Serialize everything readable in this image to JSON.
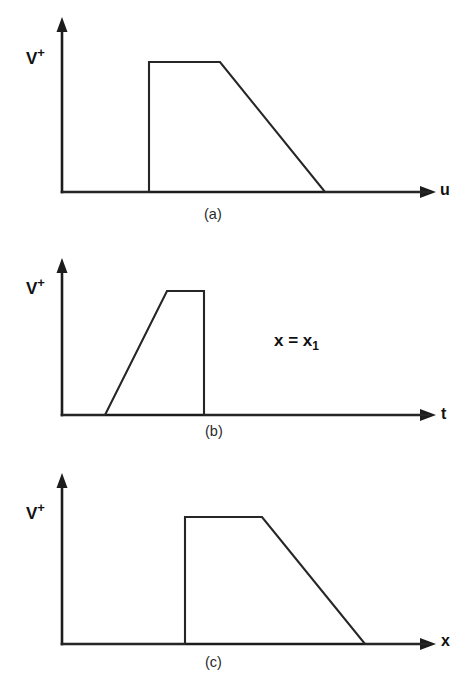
{
  "figure": {
    "background_color": "#ffffff",
    "line_color": "#262626",
    "panels": [
      {
        "id": "a",
        "caption": "(a)",
        "ylabel_base": "V",
        "ylabel_sup": "+",
        "xlabel": "u"
      },
      {
        "id": "b",
        "caption": "(b)",
        "ylabel_base": "V",
        "ylabel_sup": "+",
        "xlabel": "t",
        "annotation_base": "x = x",
        "annotation_sub": "1"
      },
      {
        "id": "c",
        "caption": "(c)",
        "ylabel_base": "V",
        "ylabel_sup": "+",
        "xlabel": "x"
      }
    ]
  },
  "chart_data": [
    {
      "type": "line",
      "title": "(a)",
      "xlabel": "u",
      "ylabel": "V+",
      "xlim": [
        0,
        400
      ],
      "ylim": [
        0,
        1.25
      ],
      "grid": false,
      "legend": "none",
      "axis_origin_px": [
        62,
        192
      ],
      "series": [
        {
          "name": "V+(u)",
          "comment": "trapezoidal pulse: instantaneous rise, flat top, linear decay to zero",
          "x": [
            62,
            149,
            149,
            220,
            325,
            430
          ],
          "y": [
            0,
            0,
            1,
            1,
            0,
            0
          ]
        }
      ]
    },
    {
      "type": "line",
      "title": "(b)",
      "xlabel": "t",
      "ylabel": "V+",
      "xlim": [
        0,
        400
      ],
      "ylim": [
        0,
        1.25
      ],
      "grid": false,
      "legend": "none",
      "annotations": [
        "x = x1"
      ],
      "axis_origin_px": [
        62,
        185
      ],
      "series": [
        {
          "name": "V+(t) at x = x1",
          "comment": "linear rise, flat top, instantaneous fall to zero",
          "x": [
            62,
            105,
            167,
            204,
            204,
            430
          ],
          "y": [
            0,
            0,
            1,
            1,
            0,
            0
          ]
        }
      ]
    },
    {
      "type": "line",
      "title": "(c)",
      "xlabel": "x",
      "ylabel": "V+",
      "xlim": [
        0,
        400
      ],
      "ylim": [
        0,
        1.25
      ],
      "grid": false,
      "legend": "none",
      "axis_origin_px": [
        62,
        192
      ],
      "series": [
        {
          "name": "V+(x)",
          "comment": "trapezoidal pulse shifted right: instantaneous rise, flat top, linear decay",
          "x": [
            62,
            185,
            185,
            262,
            365,
            430
          ],
          "y": [
            0,
            0,
            1,
            1,
            0,
            0
          ]
        }
      ]
    }
  ]
}
